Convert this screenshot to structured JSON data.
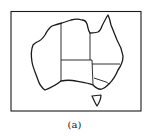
{
  "figure": {
    "caption": "(a)",
    "stroke_color": "#1a1a1a",
    "background": "#ffffff",
    "regions": [
      "Western Australia",
      "Northern Territory",
      "Queensland",
      "South Australia",
      "New South Wales",
      "Victoria",
      "Tasmania"
    ]
  }
}
